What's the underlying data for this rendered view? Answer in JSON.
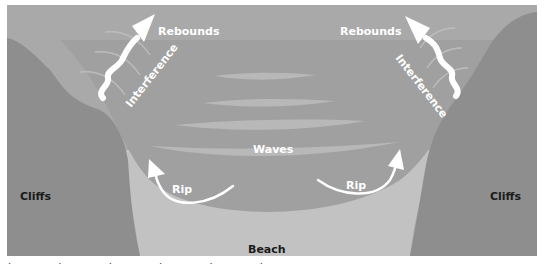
{
  "diagram": {
    "labels": {
      "rebounds_left": "Rebounds",
      "rebounds_right": "Rebounds",
      "interference_left": "Interference",
      "interference_right": "Interference",
      "waves": "Waves",
      "rip_left": "Rip",
      "rip_right": "Rip",
      "cliffs_left": "Cliffs",
      "cliffs_right": "Cliffs",
      "beach": "Beach"
    },
    "colors": {
      "background": "#ffffff",
      "open_water": "#a9a9a9",
      "cove_water": "#9d9d9d",
      "sand": "#c2c2c2",
      "cliffs": "#8e8e8e",
      "wave_lines": "#b9b9b9",
      "arrows": "#ffffff",
      "dark_text": "#1a1a1a"
    },
    "caption_partial": "· · · · · ·"
  }
}
